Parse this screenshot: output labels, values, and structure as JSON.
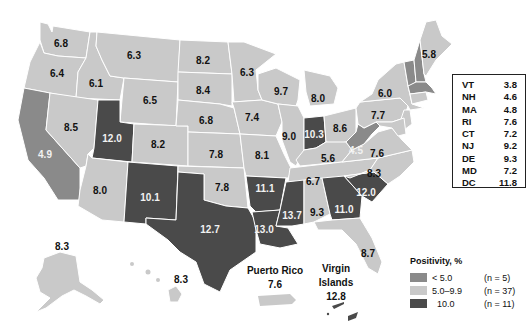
{
  "colors": {
    "low": "#8a8a8a",
    "mid": "#c9c9c9",
    "high": "#4a4a4a",
    "border": "#ffffff",
    "background": "#ffffff"
  },
  "states": {
    "WA": {
      "value": "6.8",
      "cat": "mid"
    },
    "OR": {
      "value": "6.4",
      "cat": "mid"
    },
    "CA": {
      "value": "4.9",
      "cat": "low"
    },
    "ID": {
      "value": "6.1",
      "cat": "mid"
    },
    "NV": {
      "value": "8.5",
      "cat": "mid"
    },
    "MT": {
      "value": "6.3",
      "cat": "mid"
    },
    "WY": {
      "value": "6.5",
      "cat": "mid"
    },
    "UT": {
      "value": "12.0",
      "cat": "high"
    },
    "AZ": {
      "value": "8.0",
      "cat": "mid"
    },
    "CO": {
      "value": "8.2",
      "cat": "mid"
    },
    "NM": {
      "value": "10.1",
      "cat": "high"
    },
    "ND": {
      "value": "8.2",
      "cat": "mid"
    },
    "SD": {
      "value": "8.4",
      "cat": "mid"
    },
    "NE": {
      "value": "6.8",
      "cat": "mid"
    },
    "KS": {
      "value": "7.8",
      "cat": "mid"
    },
    "OK": {
      "value": "7.8",
      "cat": "mid"
    },
    "TX": {
      "value": "12.7",
      "cat": "high"
    },
    "MN": {
      "value": "6.3",
      "cat": "mid"
    },
    "IA": {
      "value": "7.4",
      "cat": "mid"
    },
    "MO": {
      "value": "8.1",
      "cat": "mid"
    },
    "AR": {
      "value": "11.1",
      "cat": "high"
    },
    "LA": {
      "value": "13.0",
      "cat": "high"
    },
    "WI": {
      "value": "9.7",
      "cat": "mid"
    },
    "IL": {
      "value": "9.0",
      "cat": "mid"
    },
    "MI": {
      "value": "8.0",
      "cat": "mid"
    },
    "IN": {
      "value": "10.3",
      "cat": "high"
    },
    "OH": {
      "value": "8.6",
      "cat": "mid"
    },
    "KY": {
      "value": "5.6",
      "cat": "mid"
    },
    "TN": {
      "value": "6.7",
      "cat": "mid"
    },
    "MS": {
      "value": "13.7",
      "cat": "high"
    },
    "AL": {
      "value": "9.3",
      "cat": "mid"
    },
    "GA": {
      "value": "11.0",
      "cat": "high"
    },
    "FL": {
      "value": "8.7",
      "cat": "mid"
    },
    "SC": {
      "value": "12.0",
      "cat": "high"
    },
    "NC": {
      "value": "8.3",
      "cat": "mid"
    },
    "VA": {
      "value": "7.6",
      "cat": "mid"
    },
    "WV": {
      "value": "4.5",
      "cat": "low"
    },
    "PA": {
      "value": "7.7",
      "cat": "mid"
    },
    "NY": {
      "value": "6.0",
      "cat": "mid"
    },
    "ME": {
      "value": "5.8",
      "cat": "mid"
    },
    "AK": {
      "value": "8.3",
      "cat": "mid"
    },
    "HI": {
      "value": "8.3",
      "cat": "mid"
    }
  },
  "territories": {
    "puerto_rico": {
      "name": "Puerto Rico",
      "value": "7.6"
    },
    "virgin_islands": {
      "name_line1": "Virgin",
      "name_line2": "Islands",
      "value": "12.8"
    }
  },
  "northeast_box": [
    {
      "state": "VT",
      "value": "3.8"
    },
    {
      "state": "NH",
      "value": "4.6"
    },
    {
      "state": "MA",
      "value": "4.8"
    },
    {
      "state": "RI",
      "value": "7.6"
    },
    {
      "state": "CT",
      "value": "7.2"
    },
    {
      "state": "NJ",
      "value": "9.2"
    },
    {
      "state": "DE",
      "value": "9.3"
    },
    {
      "state": "MD",
      "value": "7.2"
    },
    {
      "state": "DC",
      "value": "11.8"
    }
  ],
  "legend": {
    "title": "Positivity, %",
    "items": [
      {
        "range": "< 5.0",
        "count": "(n = 5)",
        "cat": "low"
      },
      {
        "range": "5.0–9.9",
        "count": "(n = 37)",
        "cat": "mid"
      },
      {
        "range": "10.0",
        "count": "(n = 11)",
        "cat": "high"
      }
    ]
  }
}
